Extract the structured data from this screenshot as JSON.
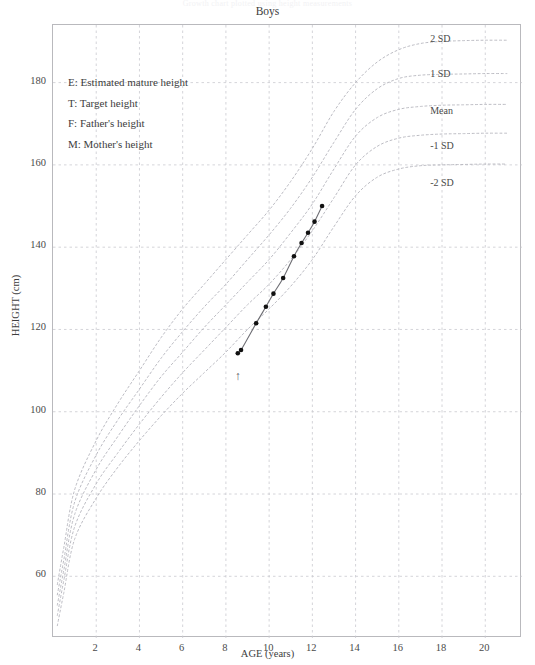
{
  "page": {
    "faint_header": "Growth chart plotted using height measurements",
    "title": "Boys",
    "background": "#ffffff"
  },
  "legend": {
    "items": [
      {
        "key": "E",
        "label": "E: Estimated mature height"
      },
      {
        "key": "T",
        "label": "T: Target height"
      },
      {
        "key": "F",
        "label": "F: Father's height"
      },
      {
        "key": "M",
        "label": "M: Mother's height"
      }
    ]
  },
  "axes": {
    "x": {
      "title": "AGE (years)",
      "ticks": [
        "2",
        "4",
        "6",
        "8",
        "10",
        "12",
        "14",
        "16",
        "18",
        "20"
      ],
      "tick_values": [
        2,
        4,
        6,
        8,
        10,
        12,
        14,
        16,
        18,
        20
      ],
      "range": [
        0,
        21.7
      ],
      "grid": true
    },
    "y": {
      "title": "HEIGHT (cm)",
      "ticks": [
        "60",
        "80",
        "100",
        "120",
        "140",
        "160",
        "180"
      ],
      "tick_values": [
        60,
        80,
        100,
        120,
        140,
        160,
        180
      ],
      "range": [
        45,
        194
      ],
      "grid": true
    }
  },
  "colors": {
    "frame": "#b9b9bd",
    "grid": "#c9c9cf",
    "reference_curve": "#b4b4bc",
    "patient_line": "#6e6e74",
    "marker": "#111111",
    "text": "#3d3d3d",
    "arrow": "#5a5a60"
  },
  "sd_labels": [
    {
      "label": "2 SD",
      "y_cm": 190.0
    },
    {
      "label": "1 SD",
      "y_cm": 181.5
    },
    {
      "label": "Mean",
      "y_cm": 172.5
    },
    {
      "label": "-1 SD",
      "y_cm": 164.0
    },
    {
      "label": "-2 SD",
      "y_cm": 155.0
    }
  ],
  "annotations": [
    {
      "name": "onset-arrow",
      "glyph": "↑",
      "age": 8.6,
      "height_cm": 108.0
    }
  ],
  "chart_data": {
    "type": "line",
    "title": "Boys",
    "xlabel": "AGE (years)",
    "ylabel": "HEIGHT (cm)",
    "xlim": [
      0,
      21.7
    ],
    "ylim": [
      45,
      194
    ],
    "grid": true,
    "legend_position": "inside-top-left",
    "series": [
      {
        "name": "2 SD",
        "kind": "reference",
        "style": "dashed",
        "x": [
          0.2,
          0.5,
          1,
          2,
          3,
          4,
          5,
          6,
          7,
          8,
          9,
          10,
          11,
          12,
          13,
          14,
          15,
          16,
          17,
          18,
          19,
          20,
          21
        ],
        "y": [
          58,
          67,
          81,
          93,
          102,
          110,
          118,
          125,
          131,
          137,
          143,
          149,
          156,
          164,
          173,
          180,
          185,
          188,
          189.5,
          190,
          190.2,
          190.3,
          190.3
        ]
      },
      {
        "name": "1 SD",
        "kind": "reference",
        "style": "dashed",
        "x": [
          0.2,
          0.5,
          1,
          2,
          3,
          4,
          5,
          6,
          7,
          8,
          9,
          10,
          11,
          12,
          13,
          14,
          15,
          16,
          17,
          18,
          19,
          20,
          21
        ],
        "y": [
          55.5,
          64,
          78,
          89.5,
          98,
          105.5,
          113,
          119.5,
          125.5,
          131,
          137,
          143,
          149.5,
          157,
          165.5,
          173.5,
          178.5,
          181,
          181.8,
          182,
          182.1,
          182.2,
          182.2
        ]
      },
      {
        "name": "Mean",
        "kind": "reference",
        "style": "dashed",
        "x": [
          0.2,
          0.5,
          1,
          2,
          3,
          4,
          5,
          6,
          7,
          8,
          9,
          10,
          11,
          12,
          13,
          14,
          15,
          16,
          17,
          18,
          19,
          20,
          21
        ],
        "y": [
          53,
          61.5,
          75,
          86,
          94,
          101.5,
          108.5,
          114.5,
          120.5,
          126,
          131.5,
          137,
          143.5,
          150.5,
          159,
          167,
          171.5,
          173.5,
          174.2,
          174.5,
          174.6,
          174.7,
          174.7
        ]
      },
      {
        "name": "-1 SD",
        "kind": "reference",
        "style": "dashed",
        "x": [
          0.2,
          0.5,
          1,
          2,
          3,
          4,
          5,
          6,
          7,
          8,
          9,
          10,
          11,
          12,
          13,
          14,
          15,
          16,
          17,
          18,
          19,
          20,
          21
        ],
        "y": [
          50.5,
          59,
          72,
          82.5,
          90,
          97,
          103.5,
          109.5,
          115,
          120.5,
          126,
          131,
          137,
          144,
          152,
          160,
          164.5,
          166.5,
          167.2,
          167.5,
          167.6,
          167.7,
          167.7
        ]
      },
      {
        "name": "-2 SD",
        "kind": "reference",
        "style": "dashed",
        "x": [
          0.2,
          0.5,
          1,
          2,
          3,
          4,
          5,
          6,
          7,
          8,
          9,
          10,
          11,
          12,
          13,
          14,
          15,
          16,
          17,
          18,
          19,
          20,
          21
        ],
        "y": [
          48,
          56,
          69,
          79,
          86.5,
          93,
          99,
          104.5,
          109.5,
          114.5,
          120,
          125,
          130.5,
          137,
          145,
          152.5,
          157,
          159,
          159.8,
          160,
          160.1,
          160.2,
          160.2
        ]
      },
      {
        "name": "Patient height",
        "kind": "measurement",
        "style": "solid-with-markers",
        "x": [
          8.55,
          8.7,
          9.4,
          9.85,
          10.2,
          10.65,
          11.15,
          11.5,
          11.8,
          12.1,
          12.45
        ],
        "y": [
          114.2,
          115.0,
          121.5,
          125.5,
          128.7,
          132.5,
          137.8,
          141.0,
          143.5,
          146.2,
          150.0
        ]
      }
    ]
  }
}
